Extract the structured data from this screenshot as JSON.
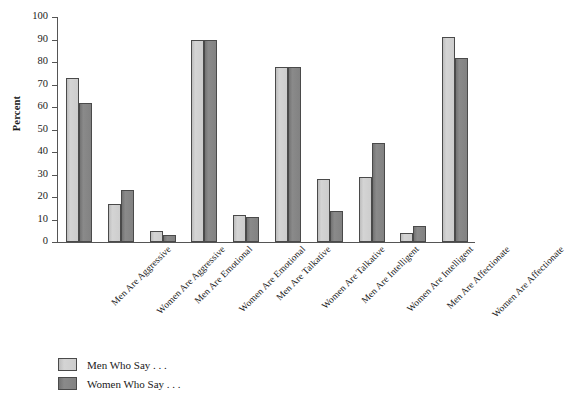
{
  "chart_data": {
    "type": "bar",
    "title": "",
    "xlabel": "",
    "ylabel": "Percent",
    "ylim": [
      0,
      100
    ],
    "ytick_step": 10,
    "yticks": [
      100,
      90,
      80,
      70,
      60,
      50,
      40,
      30,
      20,
      10,
      0
    ],
    "grid": false,
    "legend_position": "bottom-left",
    "categories": [
      "Men Are Aggressive",
      "Women Are Aggressive",
      "Men Are Emotional",
      "Women Are Emotional",
      "Men Are Talkative",
      "Women Are Talkative",
      "Men Are Intelligent",
      "Women Are Intelligent",
      "Men Are Affectionate",
      "Women Are Affectionate"
    ],
    "series": [
      {
        "name": "Men Who Say . . .",
        "color": "#cdcdcd",
        "values": [
          73,
          17,
          5,
          90,
          12,
          78,
          28,
          29,
          4,
          91
        ]
      },
      {
        "name": "Women Who Say . . .",
        "color": "#828282",
        "values": [
          62,
          23,
          3,
          90,
          11,
          78,
          14,
          44,
          7,
          82
        ]
      }
    ]
  },
  "axis": {
    "y_title": "Percent"
  },
  "legend": {
    "items": [
      {
        "label": "Men Who Say . . .",
        "swatch": "light"
      },
      {
        "label": "Women Who Say . . .",
        "swatch": "dark"
      }
    ]
  }
}
